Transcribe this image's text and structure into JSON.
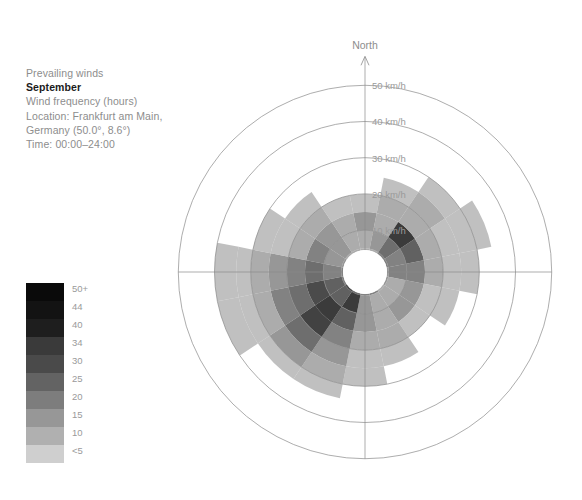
{
  "caption": {
    "line1": "Prevailing winds",
    "title": "September",
    "line3": "Wind frequency (hours)",
    "line4": "Location: Frankfurt am Main,",
    "line5": "Germany (50.0°, 8.6°)",
    "line6": "Time: 00:00–24:00"
  },
  "legend": {
    "labels": [
      "50+",
      "44",
      "40",
      "34",
      "30",
      "25",
      "20",
      "15",
      "10",
      "<5"
    ],
    "colors": [
      "#0a0a0a",
      "#131313",
      "#1e1e1e",
      "#3a3a3a",
      "#4a4a4a",
      "#636363",
      "#7d7d7d",
      "#979797",
      "#b0b0b0",
      "#cfcfcf"
    ]
  },
  "chart_data": {
    "type": "windrose",
    "subtitle": "Wind frequency (hours)",
    "location": "Frankfurt am Main, Germany (50.0°, 8.6°)",
    "time_range": "00:00–24:00",
    "north_label": "North",
    "radial_unit": "km/h",
    "radial_ticks": [
      10,
      20,
      30,
      40,
      50
    ],
    "radial_tick_labels": [
      "10 km/h",
      "20 km/h",
      "30 km/h",
      "40 km/h",
      "50 km/h"
    ],
    "rlim": [
      0,
      50
    ],
    "inner_hole_radius": 4.5,
    "grid": true,
    "legend_title": "Wind frequency (hours)",
    "legend_position": "left",
    "bin_edges": [
      0,
      5,
      10,
      15,
      20,
      25,
      30,
      34,
      40,
      44,
      50
    ],
    "bin_labels": [
      "<5",
      "10",
      "15",
      "20",
      "25",
      "30",
      "34",
      "40",
      "44",
      "50+"
    ],
    "directions": [
      "N",
      "NNE",
      "NE",
      "ENE",
      "E",
      "ESE",
      "SE",
      "SSE",
      "S",
      "SSW",
      "SW",
      "WSW",
      "W",
      "WNW",
      "NW",
      "NNW"
    ],
    "direction_angles_deg": [
      0,
      22.5,
      45,
      67.5,
      90,
      112.5,
      135,
      157.5,
      180,
      202.5,
      225,
      247.5,
      270,
      292.5,
      315,
      337.5
    ],
    "sector_width_deg": 22.5,
    "note": "cells[i] = list of hour-frequency values per speed ring, from inner (4.5-10 km/h) outward; null = no data in that ring",
    "cells": [
      {
        "dir": "N",
        "max_km_h": 22,
        "values": [
          12,
          11,
          16,
          9,
          null,
          null,
          null,
          null,
          null,
          null
        ]
      },
      {
        "dir": "NNE",
        "max_km_h": 25,
        "values": [
          14,
          16,
          13,
          11,
          8,
          null,
          null,
          null,
          null,
          null
        ]
      },
      {
        "dir": "NE",
        "max_km_h": 31,
        "values": [
          20,
          26,
          46,
          12,
          10,
          8,
          null,
          null,
          null,
          null
        ]
      },
      {
        "dir": "ENE",
        "max_km_h": 37,
        "values": [
          22,
          24,
          30,
          14,
          9,
          7,
          5,
          null,
          null,
          null
        ]
      },
      {
        "dir": "E",
        "max_km_h": 34,
        "values": [
          18,
          20,
          22,
          12,
          7,
          5,
          null,
          null,
          null,
          null
        ]
      },
      {
        "dir": "ESE",
        "max_km_h": 25,
        "values": [
          16,
          14,
          18,
          9,
          6,
          null,
          null,
          null,
          null,
          null
        ]
      },
      {
        "dir": "SE",
        "max_km_h": 22,
        "values": [
          13,
          12,
          15,
          7,
          null,
          null,
          null,
          null,
          null,
          null
        ]
      },
      {
        "dir": "SSE",
        "max_km_h": 25,
        "values": [
          20,
          14,
          10,
          12,
          6,
          null,
          null,
          null,
          null,
          null
        ]
      },
      {
        "dir": "S",
        "max_km_h": 31,
        "values": [
          22,
          18,
          16,
          14,
          9,
          6,
          null,
          null,
          null,
          null
        ]
      },
      {
        "dir": "SSW",
        "max_km_h": 34,
        "values": [
          26,
          50,
          30,
          22,
          15,
          10,
          6,
          null,
          null,
          null
        ]
      },
      {
        "dir": "SW",
        "max_km_h": 37,
        "values": [
          34,
          33,
          50,
          40,
          26,
          16,
          9,
          null,
          null,
          null
        ]
      },
      {
        "dir": "WSW",
        "max_km_h": 40,
        "values": [
          24,
          30,
          36,
          28,
          20,
          14,
          8,
          5,
          null,
          null
        ]
      },
      {
        "dir": "W",
        "max_km_h": 43,
        "values": [
          20,
          24,
          26,
          20,
          16,
          11,
          7,
          5,
          null,
          null
        ]
      },
      {
        "dir": "WNW",
        "max_km_h": 31,
        "values": [
          16,
          18,
          20,
          13,
          9,
          6,
          null,
          null,
          null,
          null
        ]
      },
      {
        "dir": "NW",
        "max_km_h": 25,
        "values": [
          14,
          15,
          17,
          10,
          7,
          null,
          null,
          null,
          null,
          null
        ]
      },
      {
        "dir": "NNW",
        "max_km_h": 22,
        "values": [
          11,
          12,
          14,
          8,
          null,
          null,
          null,
          null,
          null,
          null
        ]
      }
    ]
  },
  "geometry": {
    "cx": 365,
    "cy": 272,
    "px_per_km_h": 3.62,
    "hole_px": 22
  }
}
